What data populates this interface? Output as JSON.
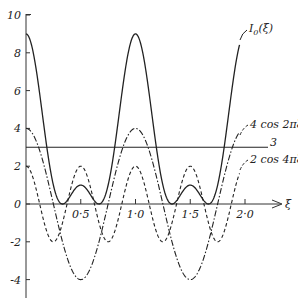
{
  "chart_data": {
    "type": "line",
    "title": "",
    "xlabel": "ξ",
    "ylabel": "",
    "xlim": [
      0,
      2.2
    ],
    "ylim": [
      -5,
      10
    ],
    "grid": false,
    "legend": "inline labels at right end of curves",
    "x_ticks": [
      {
        "value": 0.5,
        "label": "0·5"
      },
      {
        "value": 1.0,
        "label": "1·0"
      },
      {
        "value": 1.5,
        "label": "1·5"
      },
      {
        "value": 2.0,
        "label": "2·0"
      }
    ],
    "y_ticks": [
      {
        "value": 10,
        "label": "10"
      },
      {
        "value": 8,
        "label": "8"
      },
      {
        "value": 6,
        "label": "6"
      },
      {
        "value": 4,
        "label": "4"
      },
      {
        "value": 2,
        "label": "2"
      },
      {
        "value": 0,
        "label": "0"
      },
      {
        "value": -2,
        "label": "-2"
      },
      {
        "value": -4,
        "label": "-4"
      }
    ],
    "x_range_plotted": [
      0,
      1.95
    ],
    "series": [
      {
        "name": "I₀(ξ)",
        "label": "I₀(ξ)",
        "style": "solid",
        "formula": "3 + 4cos2πξ + 2cos4πξ",
        "x": [
          0,
          0.25,
          0.333,
          0.5,
          0.667,
          0.75,
          1.0,
          1.25,
          1.333,
          1.5,
          1.667,
          1.75,
          1.95
        ],
        "values": [
          9,
          1,
          0,
          1,
          0,
          1,
          9,
          1,
          0,
          1,
          0,
          1,
          8.4
        ]
      },
      {
        "name": "4cos2πξ",
        "label": "4 cos 2πξ",
        "style": "dash-dot",
        "formula": "4cos2πξ",
        "x": [
          0,
          0.25,
          0.5,
          0.75,
          1.0,
          1.25,
          1.5,
          1.75,
          1.95
        ],
        "values": [
          4,
          0,
          -4,
          0,
          4,
          0,
          -4,
          0,
          3.8
        ]
      },
      {
        "name": "2cos4πξ",
        "label": "2 cos 4πξ",
        "style": "dashed",
        "formula": "2cos4πξ",
        "x": [
          0,
          0.25,
          0.5,
          0.75,
          1.0,
          1.25,
          1.5,
          1.75,
          1.95
        ],
        "values": [
          2,
          -2,
          2,
          -2,
          2,
          -2,
          2,
          -2,
          1.6
        ]
      },
      {
        "name": "3",
        "label": "3",
        "style": "solid",
        "formula": "constant 3",
        "x": [
          0,
          2.2
        ],
        "values": [
          3,
          3
        ]
      }
    ]
  },
  "labels": {
    "i0": "I",
    "i0_sub": "0",
    "i0_arg": "(ξ)",
    "cos2": "4 cos 2πξ",
    "cos4": "2 cos 4πξ",
    "three": "3",
    "xi": "ξ"
  }
}
